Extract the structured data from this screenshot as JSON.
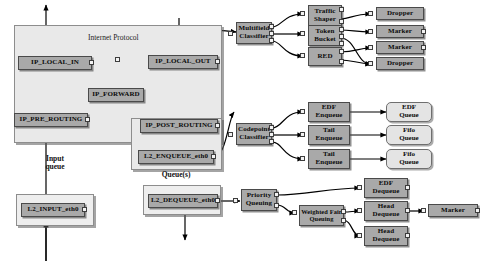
{
  "diagram": {
    "containers": [
      {
        "id": "ip",
        "label": "Internet Protocol"
      },
      {
        "id": "queues",
        "label": "Queue(s)"
      },
      {
        "id": "inputq",
        "label": "Input\nqueue"
      },
      {
        "id": "dequeue_panel",
        "label": ""
      }
    ],
    "labels": {
      "internet_protocol": "Internet Protocol",
      "queues": "Queue(s)",
      "input_queue": "Input\nqueue"
    },
    "nodes": {
      "ip_local_in": "IP_LOCAL_IN",
      "ip_local_out": "IP_LOCAL_OUT",
      "ip_forward": "IP_FORWARD",
      "ip_pre_routing": "IP_PRE_ROUTING",
      "ip_post_routing": "IP_POST_ROUTING",
      "l2_enqueue": "L2_ENQUEUE_eth0",
      "l2_input": "L2_INPUT_eth0",
      "l2_dequeue": "L2_DEQUEUE_eth0",
      "multifield_classifier": "Multifield\nClassifier",
      "traffic_shaper": "Traffic\nShaper",
      "token_bucket": "Token\nBucket",
      "red": "RED",
      "dropper_1": "Dropper",
      "marker_1": "Marker",
      "marker_2": "Marker",
      "dropper_2": "Dropper",
      "codepoint_classifier": "Codepoint\nClassifier",
      "edf_enqueue": "EDF\nEnqueue",
      "tail_enqueue_1": "Tail\nEnqueue",
      "tail_enqueue_2": "Tail\nEnqueue",
      "edf_queue": "EDF\nQueue",
      "fifo_queue_1": "Fifo\nQueue",
      "fifo_queue_2": "Fifo\nQueue",
      "priority_queuing": "Priority\nQueuing",
      "weighted_fair_queuing": "Weighted Fair\nQueuing",
      "edf_dequeue": "EDF\nDequeue",
      "head_dequeue_1": "Head\nDequeue",
      "head_dequeue_2": "Head\nDequeue",
      "marker_3": "Marker"
    },
    "colors": {
      "node_fill": "#a9a9a9",
      "node_border": "#4a4a4a",
      "queue_fill": "#e4e4e4",
      "panel_fill": "#e9e9e9",
      "panel_border": "#8d8d8d",
      "port_fill": "#f2f2f2",
      "edge": "#000000",
      "background": "#ffffff"
    }
  }
}
